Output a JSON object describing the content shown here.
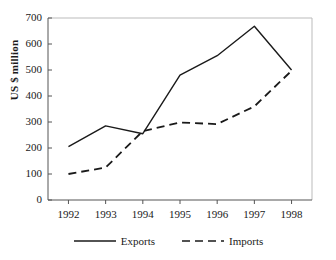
{
  "chart_data": {
    "type": "line",
    "title": "",
    "subtitle": "",
    "xlabel": "",
    "ylabel": "US $ million",
    "categories": [
      "1992",
      "1993",
      "1994",
      "1995",
      "1996",
      "1997",
      "1998"
    ],
    "x": [
      1992,
      1993,
      1994,
      1995,
      1996,
      1997,
      1998
    ],
    "series": [
      {
        "name": "Exports",
        "style": "solid",
        "color": "#1a1a1a",
        "values": [
          205,
          285,
          255,
          480,
          555,
          668,
          500
        ]
      },
      {
        "name": "Imports",
        "style": "dashed",
        "color": "#1a1a1a",
        "values": [
          100,
          125,
          265,
          298,
          292,
          360,
          497
        ]
      }
    ],
    "ylim": [
      0,
      700
    ],
    "ytick_labels": [
      "0",
      "100",
      "200",
      "300",
      "400",
      "500",
      "600",
      "700"
    ],
    "ytick_values": [
      0,
      100,
      200,
      300,
      400,
      500,
      600,
      700
    ],
    "xtick_labels": [
      "1992",
      "1993",
      "1994",
      "1995",
      "1996",
      "1997",
      "1998"
    ],
    "grid": false,
    "legend_position": "bottom",
    "legend_entries": [
      "Exports",
      "Imports"
    ],
    "axis_color": "#555555",
    "frame_color": "#bbbbbb",
    "background": "#ffffff"
  },
  "legend": {
    "exports_label": "Exports",
    "imports_label": "Imports"
  },
  "axes": {
    "y_title": "US $ million"
  }
}
